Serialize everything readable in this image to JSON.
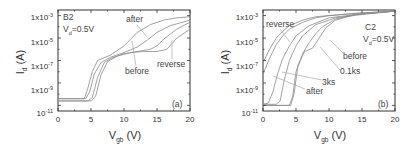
{
  "chart_data": [
    {
      "id": "a",
      "type": "line",
      "panel_label": "(a)",
      "title": "",
      "annotations": [
        "B2",
        "Vd=0.5V",
        "after",
        "before",
        "reverse",
        "(a)"
      ],
      "sample": "B2",
      "condition": "Vd=0.5V",
      "xlabel": "Vgb (V)",
      "ylabel": "Id (A)",
      "xlim": [
        0,
        20
      ],
      "ylim_log10": [
        -11.5,
        -2.5
      ],
      "yscale": "log",
      "xticks": [
        "0",
        "5",
        "10",
        "15",
        "20"
      ],
      "yticks": [
        "1x10-3",
        "1x10-5",
        "1x10-7",
        "1x10-9",
        "10-11"
      ],
      "grid": false,
      "series": [
        {
          "name": "before",
          "x": [
            0,
            4.5,
            5.2,
            6,
            7,
            8,
            10,
            12,
            14,
            15,
            16,
            18,
            20
          ],
          "log10_y": [
            -10.6,
            -10.6,
            -10.3,
            -8.5,
            -7.2,
            -6.8,
            -6.4,
            -6.2,
            -6.0,
            -5.7,
            -5.1,
            -4.2,
            -3.6
          ]
        },
        {
          "name": "after",
          "x": [
            0,
            4.0,
            4.5,
            5.2,
            6,
            8,
            10,
            12,
            14,
            16,
            18,
            20
          ],
          "log10_y": [
            -10.4,
            -10.4,
            -9.5,
            -8.0,
            -7.0,
            -6.5,
            -5.7,
            -4.5,
            -3.8,
            -3.4,
            -3.2,
            -3.1
          ]
        },
        {
          "name": "reverse",
          "x": [
            0,
            5.0,
            5.7,
            6.5,
            7.5,
            9,
            11,
            13,
            15,
            16.5,
            18,
            20
          ],
          "log10_y": [
            -10.6,
            -10.6,
            -10.2,
            -8.3,
            -7.1,
            -6.6,
            -6.3,
            -6.2,
            -6.2,
            -6.0,
            -5.0,
            -4.2
          ]
        },
        {
          "name": "intermediate",
          "x": [
            0,
            4.2,
            4.8,
            5.5,
            6.5,
            8,
            10,
            12,
            13.5,
            15,
            17,
            20
          ],
          "log10_y": [
            -10.4,
            -10.4,
            -9.8,
            -8.2,
            -7.2,
            -6.7,
            -6.3,
            -5.8,
            -5.2,
            -4.5,
            -3.9,
            -3.4
          ]
        }
      ]
    },
    {
      "id": "b",
      "type": "line",
      "panel_label": "(b)",
      "title": "",
      "annotations": [
        "C2",
        "Vd=0.5V",
        "reverse",
        "before",
        "0.1ks",
        "3ks",
        "after",
        "(b)"
      ],
      "sample": "C2",
      "condition": "Vd=0.5V",
      "xlabel": "Vgb (V)",
      "ylabel": "Id (A)",
      "xlim": [
        0,
        20
      ],
      "ylim_log10": [
        -11.5,
        -2.5
      ],
      "yscale": "log",
      "xticks": [
        "0",
        "5",
        "10",
        "15",
        "20"
      ],
      "yticks": [
        "1x10-3",
        "1x10-5",
        "1x10-7",
        "1x10-9",
        "10-11"
      ],
      "grid": false,
      "series": [
        {
          "name": "reverse",
          "x": [
            0,
            1,
            2,
            3,
            4,
            6,
            8,
            10,
            14,
            20
          ],
          "log10_y": [
            -7.2,
            -6.0,
            -5.0,
            -4.4,
            -3.9,
            -3.4,
            -3.1,
            -3.0,
            -2.8,
            -2.6
          ]
        },
        {
          "name": "reverse-2",
          "x": [
            0,
            1,
            2,
            3,
            4,
            6,
            8,
            10,
            14,
            20
          ],
          "log10_y": [
            -8.2,
            -6.8,
            -5.6,
            -4.8,
            -4.2,
            -3.6,
            -3.2,
            -3.0,
            -2.8,
            -2.6
          ]
        },
        {
          "name": "after",
          "x": [
            0,
            0.8,
            1.5,
            2.2,
            3,
            4,
            5,
            7,
            10,
            14,
            20
          ],
          "log10_y": [
            -10.9,
            -10.8,
            -9.8,
            -8.2,
            -6.8,
            -5.7,
            -4.8,
            -3.9,
            -3.2,
            -2.9,
            -2.6
          ]
        },
        {
          "name": "3ks",
          "x": [
            0,
            2.0,
            2.6,
            3.2,
            4,
            5,
            6,
            8,
            11,
            15,
            20
          ],
          "log10_y": [
            -10.9,
            -10.9,
            -10.6,
            -8.8,
            -7.0,
            -5.7,
            -4.8,
            -3.8,
            -3.2,
            -2.9,
            -2.6
          ]
        },
        {
          "name": "0.1ks",
          "x": [
            0,
            4.0,
            4.5,
            5,
            6,
            7,
            8,
            9,
            11,
            14,
            20
          ],
          "log10_y": [
            -11.0,
            -11.0,
            -10.2,
            -8.0,
            -6.4,
            -5.4,
            -4.6,
            -4.0,
            -3.3,
            -2.9,
            -2.6
          ]
        },
        {
          "name": "before",
          "x": [
            0,
            4.2,
            4.7,
            5.3,
            6.3,
            7.5,
            8.5,
            9.5,
            11,
            14,
            20
          ],
          "log10_y": [
            -11.0,
            -11.0,
            -10.0,
            -7.4,
            -6.2,
            -5.9,
            -5.0,
            -4.1,
            -3.4,
            -2.9,
            -2.6
          ]
        }
      ]
    }
  ],
  "panels": {
    "a": {
      "sample_label": "B2",
      "vd_main": "V",
      "vd_sub": "d",
      "vd_rest": "=0.5V",
      "label_after": "after",
      "label_before": "before",
      "label_reverse": "reverse",
      "panel_tag": "(a)",
      "ylabel_main": "I",
      "ylabel_sub": "d",
      "ylabel_rest": " (A)",
      "xlabel_main": "V",
      "xlabel_sub": "gb",
      "xlabel_rest": " (V)",
      "xticks": [
        "0",
        "5",
        "10",
        "15",
        "20"
      ],
      "yticks_mantissa": [
        "1x10",
        "1x10",
        "1x10",
        "1x10",
        "10"
      ],
      "yticks_exp": [
        "-3",
        "-5",
        "-7",
        "-9",
        "-11"
      ]
    },
    "b": {
      "sample_label": "C2",
      "vd_main": "V",
      "vd_sub": "d",
      "vd_rest": "=0.5V",
      "label_reverse": "reverse",
      "label_before": "before",
      "label_01ks": "0.1ks",
      "label_3ks": "3ks",
      "label_after": "after",
      "panel_tag": "(b)",
      "ylabel_main": "I",
      "ylabel_sub": "d",
      "ylabel_rest": " (A)",
      "xlabel_main": "V",
      "xlabel_sub": "gb",
      "xlabel_rest": " (V)",
      "xticks": [
        "0",
        "5",
        "10",
        "15",
        "20"
      ],
      "yticks_mantissa": [
        "1x10",
        "1x10",
        "1x10",
        "1x10",
        "10"
      ],
      "yticks_exp": [
        "-3",
        "-5",
        "-7",
        "-9",
        "-11"
      ]
    }
  }
}
